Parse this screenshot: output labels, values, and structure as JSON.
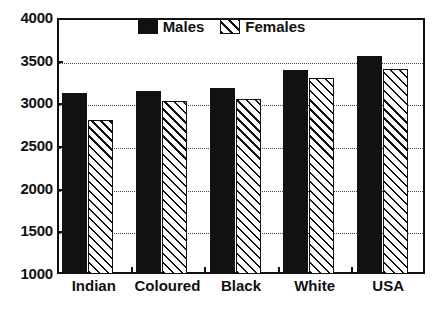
{
  "chart_data": {
    "type": "bar",
    "title": "",
    "subtitle": "",
    "xlabel": "",
    "ylabel": "",
    "categories": [
      "Indian",
      "Coloured",
      "Black",
      "White",
      "USA"
    ],
    "series": [
      {
        "name": "Males",
        "values": [
          3120,
          3150,
          3185,
          3395,
          3555
        ]
      },
      {
        "name": "Females",
        "values": [
          2810,
          3030,
          3055,
          3295,
          3400
        ]
      }
    ],
    "ylim": [
      1000,
      4000
    ],
    "yticks": [
      1000,
      1500,
      2000,
      2500,
      3000,
      3500,
      4000
    ],
    "ytick_labels": [
      "1000",
      "1500",
      "2000",
      "2500",
      "3000",
      "3500",
      "4000"
    ],
    "grid": true,
    "grid_style": "dotted-horizontal",
    "legend_position": "top-center",
    "legend": [
      "Males",
      "Females"
    ],
    "colors": {
      "males": "#111111",
      "females_fill": "#ffffff",
      "females_hatch": "#111111",
      "axis": "#111111",
      "grid": "#4a4a4a",
      "background": "#ffffff"
    }
  }
}
